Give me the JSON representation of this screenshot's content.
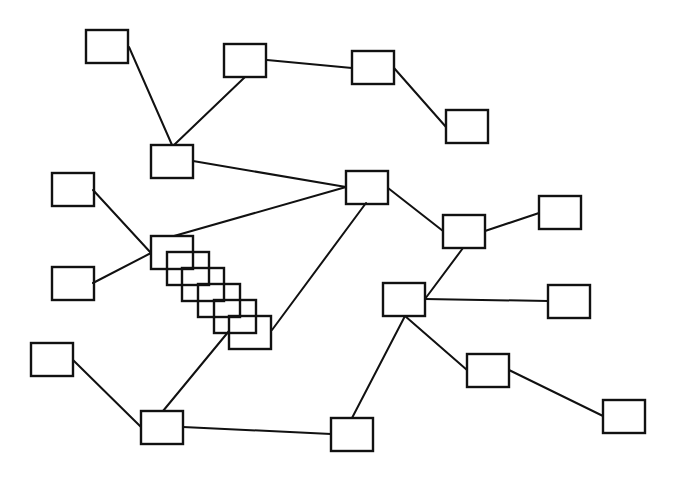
{
  "diagram": {
    "type": "network-graph",
    "width": 679,
    "height": 477,
    "background": "#ffffff",
    "stroke_color": "#111111",
    "node_size": {
      "w": 42,
      "h": 33
    },
    "nodes": [
      {
        "id": "n1",
        "x": 86,
        "y": 30,
        "label": ""
      },
      {
        "id": "n2",
        "x": 224,
        "y": 44,
        "label": ""
      },
      {
        "id": "n3",
        "x": 352,
        "y": 51,
        "label": ""
      },
      {
        "id": "n4",
        "x": 446,
        "y": 110,
        "label": ""
      },
      {
        "id": "n5",
        "x": 151,
        "y": 145,
        "label": ""
      },
      {
        "id": "n6",
        "x": 52,
        "y": 173,
        "label": ""
      },
      {
        "id": "n7",
        "x": 346,
        "y": 171,
        "label": ""
      },
      {
        "id": "n8",
        "x": 539,
        "y": 196,
        "label": ""
      },
      {
        "id": "n9",
        "x": 443,
        "y": 215,
        "label": ""
      },
      {
        "id": "s1",
        "x": 151,
        "y": 236,
        "label": "",
        "group": "stack"
      },
      {
        "id": "s2",
        "x": 167,
        "y": 252,
        "label": "",
        "group": "stack"
      },
      {
        "id": "s3",
        "x": 182,
        "y": 268,
        "label": "",
        "group": "stack"
      },
      {
        "id": "s4",
        "x": 198,
        "y": 284,
        "label": "",
        "group": "stack"
      },
      {
        "id": "s5",
        "x": 214,
        "y": 300,
        "label": "",
        "group": "stack"
      },
      {
        "id": "s6",
        "x": 229,
        "y": 316,
        "label": "",
        "group": "stack"
      },
      {
        "id": "n10",
        "x": 52,
        "y": 267,
        "label": ""
      },
      {
        "id": "n11",
        "x": 383,
        "y": 283,
        "label": ""
      },
      {
        "id": "n12",
        "x": 548,
        "y": 285,
        "label": ""
      },
      {
        "id": "n13",
        "x": 31,
        "y": 343,
        "label": ""
      },
      {
        "id": "n14",
        "x": 467,
        "y": 354,
        "label": ""
      },
      {
        "id": "n15",
        "x": 603,
        "y": 400,
        "label": ""
      },
      {
        "id": "n16",
        "x": 141,
        "y": 411,
        "label": ""
      },
      {
        "id": "n17",
        "x": 331,
        "y": 418,
        "label": ""
      }
    ],
    "edges": [
      {
        "from": "n1",
        "to": "n5",
        "x1": 129,
        "y1": 47,
        "x2": 172,
        "y2": 145
      },
      {
        "from": "n2",
        "to": "n5",
        "x1": 245,
        "y1": 77,
        "x2": 174,
        "y2": 145
      },
      {
        "from": "n2",
        "to": "n3",
        "x1": 267,
        "y1": 60,
        "x2": 352,
        "y2": 68
      },
      {
        "from": "n3",
        "to": "n4",
        "x1": 394,
        "y1": 68,
        "x2": 446,
        "y2": 127
      },
      {
        "from": "n5",
        "to": "n7",
        "x1": 193,
        "y1": 161,
        "x2": 346,
        "y2": 187
      },
      {
        "from": "n6",
        "to": "s1",
        "x1": 93,
        "y1": 190,
        "x2": 151,
        "y2": 253
      },
      {
        "from": "n10",
        "to": "s1",
        "x1": 93,
        "y1": 283,
        "x2": 151,
        "y2": 253
      },
      {
        "from": "s1",
        "to": "n7",
        "x1": 174,
        "y1": 236,
        "x2": 346,
        "y2": 187
      },
      {
        "from": "s6",
        "to": "n7",
        "x1": 272,
        "y1": 330,
        "x2": 366,
        "y2": 203
      },
      {
        "from": "n7",
        "to": "n9",
        "x1": 388,
        "y1": 188,
        "x2": 443,
        "y2": 231
      },
      {
        "from": "n9",
        "to": "n8",
        "x1": 485,
        "y1": 231,
        "x2": 539,
        "y2": 213
      },
      {
        "from": "n9",
        "to": "n11",
        "x1": 463,
        "y1": 248,
        "x2": 425,
        "y2": 299
      },
      {
        "from": "n11",
        "to": "n12",
        "x1": 425,
        "y1": 299,
        "x2": 548,
        "y2": 301
      },
      {
        "from": "n11",
        "to": "n14",
        "x1": 405,
        "y1": 316,
        "x2": 467,
        "y2": 370
      },
      {
        "from": "n14",
        "to": "n15",
        "x1": 509,
        "y1": 370,
        "x2": 603,
        "y2": 416
      },
      {
        "from": "n11",
        "to": "n17",
        "x1": 405,
        "y1": 316,
        "x2": 352,
        "y2": 418
      },
      {
        "from": "n13",
        "to": "n16",
        "x1": 73,
        "y1": 360,
        "x2": 141,
        "y2": 427
      },
      {
        "from": "s6",
        "to": "n16",
        "x1": 229,
        "y1": 331,
        "x2": 163,
        "y2": 411
      },
      {
        "from": "n16",
        "to": "n17",
        "x1": 183,
        "y1": 427,
        "x2": 331,
        "y2": 434
      }
    ]
  }
}
